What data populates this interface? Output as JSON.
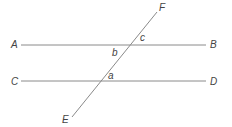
{
  "diagram": {
    "title": "",
    "colors": {
      "line": "#8a8a8a",
      "text": "#444444",
      "background": "#ffffff"
    },
    "lines": [
      {
        "id": "AB",
        "x1": 21,
        "y1": 45,
        "x2": 206,
        "y2": 45
      },
      {
        "id": "CD",
        "x1": 21,
        "y1": 81,
        "x2": 206,
        "y2": 81
      },
      {
        "id": "EF",
        "x1": 72,
        "y1": 117,
        "x2": 157,
        "y2": 12
      }
    ],
    "points": [
      {
        "label": "A",
        "x": 11,
        "y": 48
      },
      {
        "label": "B",
        "x": 210,
        "y": 48
      },
      {
        "label": "C",
        "x": 11,
        "y": 85
      },
      {
        "label": "D",
        "x": 210,
        "y": 85
      },
      {
        "label": "E",
        "x": 62,
        "y": 123
      },
      {
        "label": "F",
        "x": 159,
        "y": 11
      }
    ],
    "angles": [
      {
        "label": "c",
        "x": 140,
        "y": 41
      },
      {
        "label": "b",
        "x": 112,
        "y": 56
      },
      {
        "label": "a",
        "x": 108,
        "y": 79
      }
    ]
  }
}
